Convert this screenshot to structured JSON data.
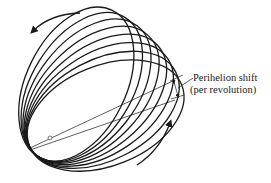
{
  "diagram": {
    "annotation": {
      "line1": "Perihelion shift",
      "line2": "(per revolution)"
    },
    "orbit_count": 8,
    "colors": {
      "stroke": "#1a1a1a",
      "background": "#ffffff"
    }
  }
}
